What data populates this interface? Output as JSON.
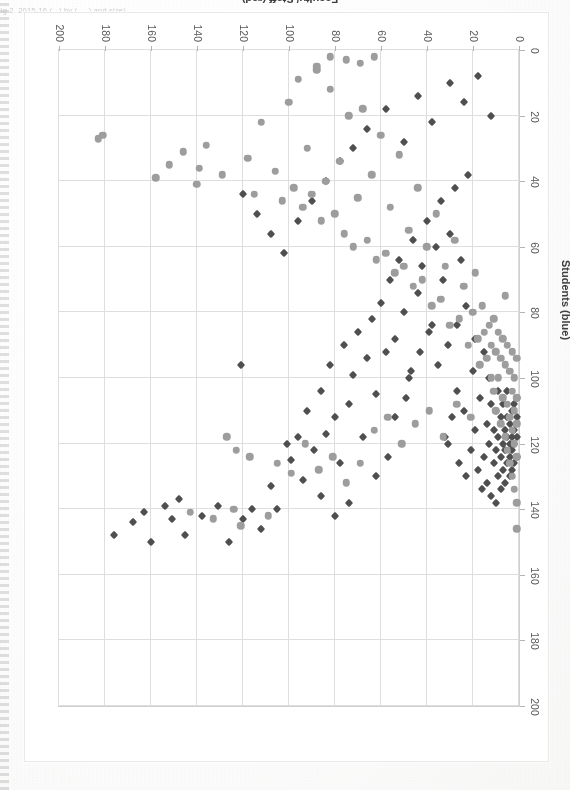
{
  "page": {
    "caption_fragment": "Fig 2.  2015-16  (...) by (.....) and size)",
    "background_color": "#fcfcfc"
  },
  "chart_data": {
    "type": "scatter",
    "title": "",
    "orientation_note": "figure printed upside-down (rotated 180°) on the page",
    "xlabel": "Faculty/ Staff (red)",
    "ylabel": "Students (blue)",
    "xlim": [
      0,
      200
    ],
    "ylim": [
      0,
      200
    ],
    "x_ticks": [
      0,
      20,
      40,
      60,
      80,
      100,
      120,
      140,
      160,
      180,
      200
    ],
    "y_ticks": [
      0,
      20,
      40,
      60,
      80,
      100,
      120,
      140,
      160,
      180,
      200
    ],
    "x_axis_reversed_on_screen": true,
    "grid": true,
    "legend": "none",
    "series": [
      {
        "name": "Faculty/ Staff (red)",
        "color": "#4a4a4a",
        "marker": "diamond",
        "points": [
          [
            176,
            148
          ],
          [
            168,
            144
          ],
          [
            163,
            141
          ],
          [
            160,
            150
          ],
          [
            154,
            139
          ],
          [
            151,
            143
          ],
          [
            148,
            137
          ],
          [
            145,
            148
          ],
          [
            138,
            142
          ],
          [
            131,
            139
          ],
          [
            126,
            150
          ],
          [
            120,
            143
          ],
          [
            116,
            140
          ],
          [
            112,
            146
          ],
          [
            108,
            133
          ],
          [
            105,
            140
          ],
          [
            101,
            120
          ],
          [
            99,
            125
          ],
          [
            96,
            118
          ],
          [
            94,
            131
          ],
          [
            92,
            110
          ],
          [
            89,
            122
          ],
          [
            86,
            104
          ],
          [
            84,
            117
          ],
          [
            82,
            96
          ],
          [
            80,
            112
          ],
          [
            78,
            126
          ],
          [
            76,
            90
          ],
          [
            74,
            108
          ],
          [
            72,
            99
          ],
          [
            70,
            86
          ],
          [
            68,
            118
          ],
          [
            66,
            94
          ],
          [
            64,
            82
          ],
          [
            62,
            105
          ],
          [
            60,
            77
          ],
          [
            58,
            92
          ],
          [
            56,
            70
          ],
          [
            54,
            88
          ],
          [
            52,
            64
          ],
          [
            50,
            80
          ],
          [
            48,
            100
          ],
          [
            46,
            58
          ],
          [
            44,
            74
          ],
          [
            42,
            66
          ],
          [
            40,
            52
          ],
          [
            38,
            84
          ],
          [
            36,
            60
          ],
          [
            34,
            46
          ],
          [
            33,
            70
          ],
          [
            32,
            118
          ],
          [
            31,
            120
          ],
          [
            30,
            56
          ],
          [
            29,
            112
          ],
          [
            28,
            42
          ],
          [
            27,
            104
          ],
          [
            26,
            126
          ],
          [
            25,
            64
          ],
          [
            24,
            110
          ],
          [
            23,
            130
          ],
          [
            22,
            38
          ],
          [
            21,
            122
          ],
          [
            20,
            98
          ],
          [
            19,
            116
          ],
          [
            18,
            128
          ],
          [
            17,
            106
          ],
          [
            16,
            134
          ],
          [
            15,
            92
          ],
          [
            15,
            124
          ],
          [
            14,
            114
          ],
          [
            14,
            132
          ],
          [
            13,
            120
          ],
          [
            13,
            100
          ],
          [
            12,
            136
          ],
          [
            12,
            108
          ],
          [
            11,
            126
          ],
          [
            11,
            116
          ],
          [
            10,
            138
          ],
          [
            10,
            122
          ],
          [
            10,
            110
          ],
          [
            9,
            130
          ],
          [
            9,
            118
          ],
          [
            9,
            104
          ],
          [
            8,
            134
          ],
          [
            8,
            124
          ],
          [
            8,
            112
          ],
          [
            7,
            128
          ],
          [
            7,
            120
          ],
          [
            7,
            108
          ],
          [
            6,
            132
          ],
          [
            6,
            122
          ],
          [
            6,
            116
          ],
          [
            5,
            126
          ],
          [
            5,
            118
          ],
          [
            5,
            112
          ],
          [
            5,
            104
          ],
          [
            4,
            130
          ],
          [
            4,
            124
          ],
          [
            4,
            120
          ],
          [
            4,
            114
          ],
          [
            3,
            128
          ],
          [
            3,
            122
          ],
          [
            3,
            118
          ],
          [
            3,
            110
          ],
          [
            2,
            126
          ],
          [
            2,
            120
          ],
          [
            2,
            116
          ],
          [
            2,
            108
          ],
          [
            1,
            124
          ],
          [
            1,
            118
          ],
          [
            1,
            112
          ],
          [
            1,
            106
          ],
          [
            72,
            30
          ],
          [
            66,
            24
          ],
          [
            58,
            18
          ],
          [
            50,
            28
          ],
          [
            44,
            14
          ],
          [
            38,
            22
          ],
          [
            30,
            10
          ],
          [
            24,
            16
          ],
          [
            18,
            8
          ],
          [
            12,
            20
          ],
          [
            96,
            52
          ],
          [
            90,
            46
          ],
          [
            84,
            40
          ],
          [
            78,
            34
          ],
          [
            102,
            62
          ],
          [
            108,
            56
          ],
          [
            114,
            50
          ],
          [
            120,
            44
          ],
          [
            47,
            98
          ],
          [
            43,
            92
          ],
          [
            39,
            86
          ],
          [
            35,
            96
          ],
          [
            31,
            90
          ],
          [
            27,
            84
          ],
          [
            23,
            78
          ],
          [
            19,
            88
          ],
          [
            54,
            112
          ],
          [
            49,
            106
          ],
          [
            62,
            130
          ],
          [
            57,
            124
          ],
          [
            86,
            136
          ],
          [
            80,
            142
          ],
          [
            74,
            138
          ],
          [
            121,
            96
          ]
        ]
      },
      {
        "name": "Students (blue)",
        "color": "#9a9a9a",
        "marker": "circle",
        "points": [
          [
            183,
            27
          ],
          [
            181,
            26
          ],
          [
            158,
            39
          ],
          [
            152,
            35
          ],
          [
            146,
            31
          ],
          [
            143,
            141
          ],
          [
            140,
            41
          ],
          [
            139,
            36
          ],
          [
            136,
            29
          ],
          [
            133,
            143
          ],
          [
            129,
            38
          ],
          [
            124,
            140
          ],
          [
            121,
            145
          ],
          [
            118,
            33
          ],
          [
            115,
            44
          ],
          [
            112,
            22
          ],
          [
            109,
            142
          ],
          [
            106,
            37
          ],
          [
            103,
            46
          ],
          [
            100,
            16
          ],
          [
            98,
            42
          ],
          [
            96,
            9
          ],
          [
            94,
            48
          ],
          [
            92,
            30
          ],
          [
            90,
            44
          ],
          [
            88,
            6
          ],
          [
            86,
            52
          ],
          [
            84,
            40
          ],
          [
            82,
            12
          ],
          [
            80,
            50
          ],
          [
            78,
            34
          ],
          [
            76,
            56
          ],
          [
            74,
            20
          ],
          [
            72,
            60
          ],
          [
            70,
            45
          ],
          [
            68,
            18
          ],
          [
            66,
            58
          ],
          [
            64,
            38
          ],
          [
            62,
            64
          ],
          [
            60,
            26
          ],
          [
            58,
            62
          ],
          [
            56,
            48
          ],
          [
            54,
            68
          ],
          [
            52,
            32
          ],
          [
            50,
            66
          ],
          [
            48,
            55
          ],
          [
            46,
            72
          ],
          [
            44,
            42
          ],
          [
            42,
            70
          ],
          [
            40,
            60
          ],
          [
            38,
            78
          ],
          [
            36,
            50
          ],
          [
            34,
            76
          ],
          [
            32,
            66
          ],
          [
            30,
            84
          ],
          [
            28,
            58
          ],
          [
            26,
            82
          ],
          [
            24,
            72
          ],
          [
            22,
            90
          ],
          [
            20,
            80
          ],
          [
            19,
            68
          ],
          [
            18,
            88
          ],
          [
            17,
            96
          ],
          [
            16,
            78
          ],
          [
            15,
            86
          ],
          [
            14,
            94
          ],
          [
            13,
            84
          ],
          [
            12,
            100
          ],
          [
            12,
            90
          ],
          [
            11,
            82
          ],
          [
            11,
            104
          ],
          [
            10,
            92
          ],
          [
            10,
            110
          ],
          [
            9,
            86
          ],
          [
            9,
            100
          ],
          [
            8,
            94
          ],
          [
            8,
            114
          ],
          [
            7,
            88
          ],
          [
            7,
            106
          ],
          [
            6,
            96
          ],
          [
            6,
            118
          ],
          [
            5,
            90
          ],
          [
            5,
            108
          ],
          [
            5,
            122
          ],
          [
            4,
            98
          ],
          [
            4,
            112
          ],
          [
            4,
            126
          ],
          [
            3,
            92
          ],
          [
            3,
            104
          ],
          [
            3,
            116
          ],
          [
            3,
            130
          ],
          [
            2,
            100
          ],
          [
            2,
            110
          ],
          [
            2,
            120
          ],
          [
            2,
            134
          ],
          [
            1,
            94
          ],
          [
            1,
            106
          ],
          [
            1,
            114
          ],
          [
            1,
            124
          ],
          [
            1,
            138
          ],
          [
            1,
            146
          ],
          [
            6,
            75
          ],
          [
            117,
            124
          ],
          [
            123,
            122
          ],
          [
            127,
            118
          ],
          [
            105,
            126
          ],
          [
            99,
            129
          ],
          [
            93,
            120
          ],
          [
            87,
            128
          ],
          [
            81,
            124
          ],
          [
            75,
            132
          ],
          [
            69,
            126
          ],
          [
            63,
            116
          ],
          [
            57,
            112
          ],
          [
            51,
            120
          ],
          [
            45,
            114
          ],
          [
            39,
            110
          ],
          [
            33,
            118
          ],
          [
            27,
            108
          ],
          [
            21,
            112
          ],
          [
            75,
            3
          ],
          [
            69,
            4
          ],
          [
            63,
            2
          ],
          [
            88,
            5
          ],
          [
            82,
            2
          ]
        ]
      }
    ]
  },
  "axes": {
    "x": {
      "title": "Faculty/ Staff (red)",
      "labels": [
        "0",
        "20",
        "40",
        "60",
        "80",
        "100",
        "120",
        "140",
        "160",
        "180",
        "200"
      ]
    },
    "y": {
      "title": "Students (blue)",
      "labels": [
        "0",
        "20",
        "40",
        "60",
        "80",
        "100",
        "120",
        "140",
        "160",
        "180",
        "200"
      ]
    }
  }
}
